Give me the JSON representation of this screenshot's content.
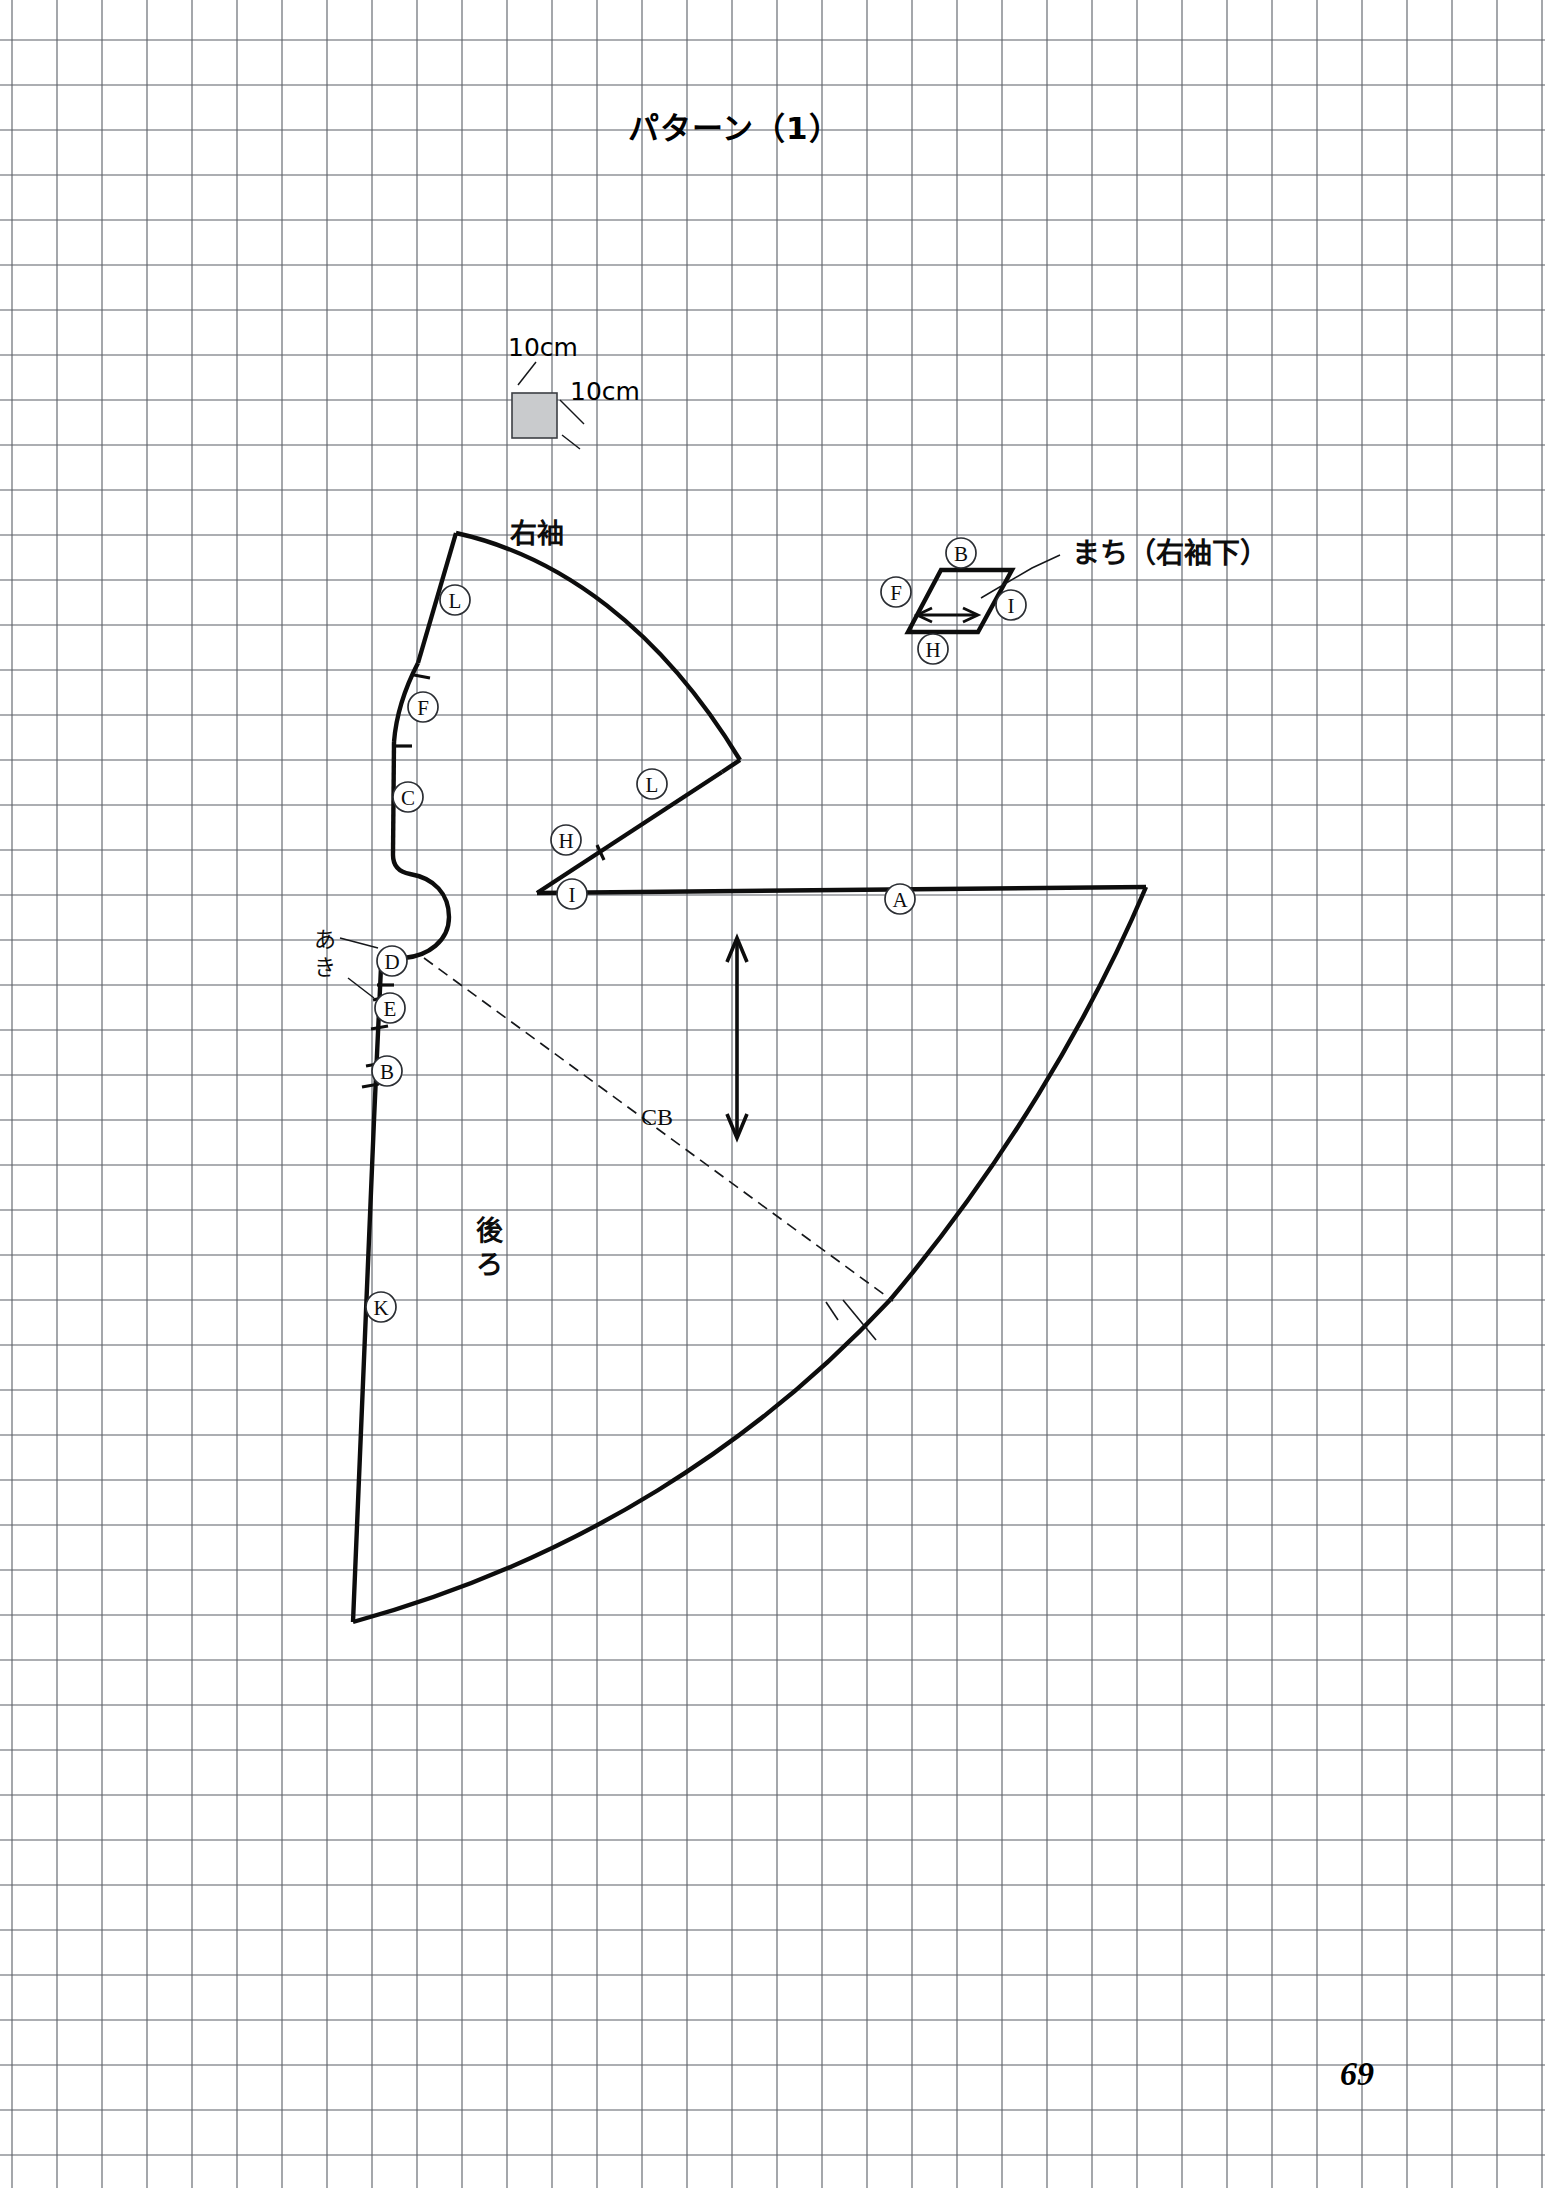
{
  "page": {
    "title": "パターン（1）",
    "page_number": "69",
    "background_color": "#ffffff",
    "grid_color": "#5a5f66",
    "ink_color": "#0d0d0d"
  },
  "scale_key": {
    "label_top": "10cm",
    "label_right": "10cm",
    "swatch_color": "#c9cbcd"
  },
  "pieces": [
    {
      "id": "right-sleeve",
      "label": "右袖",
      "notches": [
        "L",
        "F",
        "C",
        "L",
        "H",
        "I"
      ]
    },
    {
      "id": "back",
      "label": "後ろ",
      "notches": [
        "A",
        "D",
        "E",
        "B",
        "K"
      ],
      "center_back_label": "CB",
      "opening_label": "あき"
    },
    {
      "id": "gusset",
      "label": "まち（右袖下）",
      "notches": [
        "B",
        "F",
        "I",
        "H"
      ]
    }
  ],
  "notch_marks": {
    "sleeve_L_upper": "L",
    "sleeve_F": "F",
    "sleeve_C": "C",
    "sleeve_L_lower": "L",
    "sleeve_H": "H",
    "sleeve_I": "I",
    "back_A": "A",
    "back_D": "D",
    "back_E": "E",
    "back_B": "B",
    "back_K": "K",
    "gusset_B": "B",
    "gusset_F": "F",
    "gusset_I": "I",
    "gusset_H": "H"
  },
  "annotations": {
    "opening": "あき",
    "center_back": "CB",
    "gusset_title": "まち（右袖下）"
  },
  "chart_data": {
    "type": "diagram",
    "title": "パターン（1）",
    "grid_cell_cm": 10,
    "grid_cell_px": 45,
    "pieces": [
      "右袖",
      "後ろ",
      "まち（右袖下）"
    ]
  }
}
